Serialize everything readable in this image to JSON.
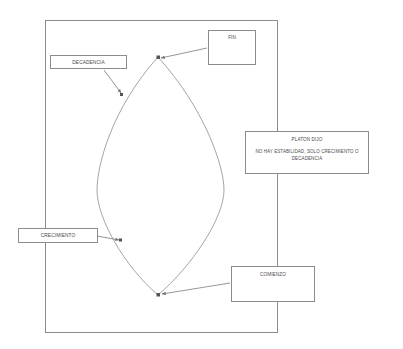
{
  "diagram": {
    "stroke_color": "#8c8c8c",
    "text_color": "#4a4a4a",
    "background_color": "#ffffff",
    "outer_frame": {
      "name": "outer-frame-rectangle"
    },
    "lens_shape": {
      "name": "lens-vesica-shape",
      "description": "two-arc lens joining top and bottom vertices"
    },
    "nodes": [
      {
        "id": "fin",
        "label": "FIN"
      },
      {
        "id": "decadencia",
        "label": "DECADENCIA"
      },
      {
        "id": "platon",
        "label": "PLATON DIJO",
        "quote": "NO HAY ESTABILIDAD, SOLO CRECIMIENTO O DECADENCIA"
      },
      {
        "id": "crecimiento",
        "label": "CRECIMIENTO"
      },
      {
        "id": "comienzo",
        "label": "COMIENZO"
      }
    ],
    "connectors": [
      {
        "id": "fin-to-top-vertex",
        "from": "fin",
        "to": "lens-top-vertex",
        "arrow": "end"
      },
      {
        "id": "decadencia-to-upper-left-arc",
        "from": "decadencia",
        "to": "lens-upper-left-arc",
        "arrow": "end"
      },
      {
        "id": "crecimiento-to-lower-left-arc",
        "from": "crecimiento",
        "to": "lens-lower-left-arc",
        "arrow": "end"
      },
      {
        "id": "comienzo-to-bottom-vertex",
        "from": "comienzo",
        "to": "lens-bottom-vertex",
        "arrow": "end"
      }
    ]
  }
}
